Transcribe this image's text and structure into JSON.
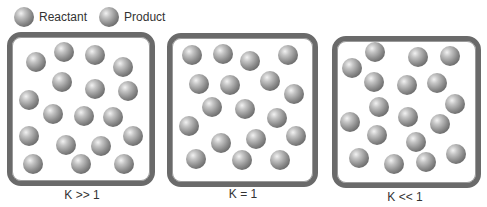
{
  "legend": {
    "items": [
      {
        "label": "Reactant",
        "icon": "reactant-sphere-icon"
      },
      {
        "label": "Product",
        "icon": "product-sphere-icon"
      }
    ]
  },
  "panels": [
    {
      "label": "K >> 1",
      "box": {
        "left": 7,
        "top": 32,
        "width": 148,
        "height": 154
      },
      "caption": {
        "left": 22,
        "top": 188
      },
      "molecules": [
        [
          36,
          62
        ],
        [
          64,
          52
        ],
        [
          95,
          55
        ],
        [
          123,
          67
        ],
        [
          62,
          82
        ],
        [
          95,
          89
        ],
        [
          128,
          91
        ],
        [
          29,
          100
        ],
        [
          53,
          114
        ],
        [
          84,
          116
        ],
        [
          113,
          117
        ],
        [
          29,
          136
        ],
        [
          66,
          145
        ],
        [
          101,
          146
        ],
        [
          133,
          136
        ],
        [
          33,
          164
        ],
        [
          81,
          164
        ],
        [
          124,
          164
        ]
      ]
    },
    {
      "label": "K = 1",
      "box": {
        "left": 167,
        "top": 33,
        "width": 151,
        "height": 154
      },
      "caption": {
        "left": 183,
        "top": 187
      },
      "molecules": [
        [
          192,
          55
        ],
        [
          223,
          54
        ],
        [
          250,
          61
        ],
        [
          288,
          55
        ],
        [
          199,
          84
        ],
        [
          230,
          85
        ],
        [
          270,
          81
        ],
        [
          294,
          94
        ],
        [
          212,
          107
        ],
        [
          245,
          109
        ],
        [
          277,
          118
        ],
        [
          189,
          126
        ],
        [
          221,
          143
        ],
        [
          256,
          139
        ],
        [
          296,
          136
        ],
        [
          196,
          159
        ],
        [
          242,
          160
        ],
        [
          280,
          160
        ]
      ]
    },
    {
      "label": "K << 1",
      "box": {
        "left": 332,
        "top": 36,
        "width": 149,
        "height": 152
      },
      "caption": {
        "left": 345,
        "top": 190
      },
      "molecules": [
        [
          352,
          68
        ],
        [
          375,
          52
        ],
        [
          418,
          57
        ],
        [
          450,
          56
        ],
        [
          374,
          82
        ],
        [
          407,
          85
        ],
        [
          437,
          83
        ],
        [
          455,
          104
        ],
        [
          379,
          107
        ],
        [
          408,
          117
        ],
        [
          440,
          124
        ],
        [
          350,
          122
        ],
        [
          377,
          135
        ],
        [
          416,
          142
        ],
        [
          456,
          154
        ],
        [
          359,
          158
        ],
        [
          394,
          164
        ],
        [
          426,
          162
        ]
      ]
    }
  ]
}
